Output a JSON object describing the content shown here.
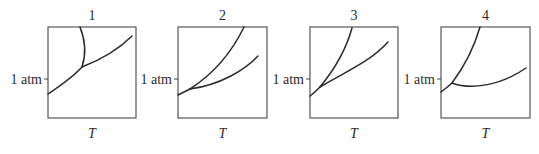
{
  "figure": {
    "panels": [
      {
        "title": "1",
        "x_label": "T",
        "y_tick_label": "1 atm",
        "box": {
          "x": 48,
          "y": 27,
          "w": 88,
          "h": 91
        },
        "tick_y": 79,
        "curves": [
          "M48,94 C60,86 72,78 82,67",
          "M82,67 C86,55 86,42 80,27",
          "M82,67 C100,60 118,50 132,36"
        ]
      },
      {
        "title": "2",
        "x_label": "T",
        "y_tick_label": "1 atm",
        "box": {
          "x": 178,
          "y": 27,
          "w": 89,
          "h": 91
        },
        "tick_y": 79,
        "curves": [
          "M178,95 C182,93 186,91 190,89",
          "M190,89 C210,76 230,56 244,27",
          "M190,89 C220,85 245,70 258,56"
        ]
      },
      {
        "title": "3",
        "x_label": "T",
        "y_tick_label": "1 atm",
        "box": {
          "x": 310,
          "y": 27,
          "w": 88,
          "h": 91
        },
        "tick_y": 79,
        "curves": [
          "M310,96 C314,93 317,90 320,87",
          "M320,87 C334,70 346,50 352,28",
          "M320,87 C345,72 370,62 388,42"
        ]
      },
      {
        "title": "4",
        "x_label": "T",
        "y_tick_label": "1 atm",
        "box": {
          "x": 441,
          "y": 27,
          "w": 89,
          "h": 91
        },
        "tick_y": 79,
        "curves": [
          "M441,92 C446,88 449,86 452,83",
          "M452,83 C464,67 474,48 480,27",
          "M452,83 C470,90 500,86 526,68"
        ]
      }
    ]
  }
}
